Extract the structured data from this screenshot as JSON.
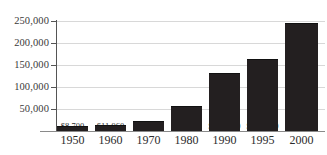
{
  "chart_data": {
    "type": "bar",
    "title": "",
    "xlabel": "",
    "ylabel": "",
    "categories": [
      "1950",
      "1960",
      "1970",
      "1980",
      "1990",
      "1995",
      "2000"
    ],
    "values": [
      8700,
      11960,
      19550,
      54780,
      128640,
      160930,
      243680
    ],
    "data_labels": [
      "$8,700",
      "$11,960",
      "$19,550",
      "$54,780",
      "$128,640",
      "$160,930",
      "$243,680"
    ],
    "ylim": [
      0,
      250000
    ],
    "ytick_values": [
      50000,
      100000,
      150000,
      200000,
      250000
    ],
    "ytick_labels": [
      "50,000",
      "100,000",
      "150,000",
      "200,000",
      "250,000"
    ],
    "grid": true,
    "legend": false,
    "legend_position": "none",
    "bar_color": "#231f20",
    "gridline_color": "#d8d8d8",
    "axis_color": "#555555",
    "background_color": "#ffffff",
    "text_color": "#2b2b2b"
  }
}
